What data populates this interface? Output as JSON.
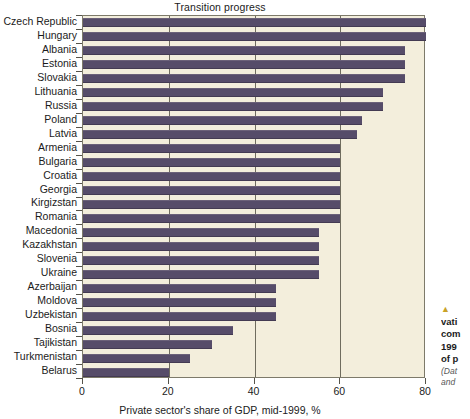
{
  "chart_data": {
    "type": "bar",
    "orientation": "horizontal",
    "title": "Transition progress",
    "xlabel": "Private sector's share of GDP, mid-1999, %",
    "ylabel": "",
    "xlim": [
      0,
      80
    ],
    "xticks": [
      0,
      20,
      40,
      60,
      80
    ],
    "grid": true,
    "grid_axis": "x",
    "legend": null,
    "series_color": "#564c69",
    "plot_background": "#f3eedc",
    "categories": [
      "Czech Republic",
      "Hungary",
      "Albania",
      "Estonia",
      "Slovakia",
      "Lithuania",
      "Russia",
      "Poland",
      "Latvia",
      "Armenia",
      "Bulgaria",
      "Croatia",
      "Georgia",
      "Kirgizstan",
      "Romania",
      "Macedonia",
      "Kazakhstan",
      "Slovenia",
      "Ukraine",
      "Azerbaijan",
      "Moldova",
      "Uzbekistan",
      "Bosnia",
      "Tajikistan",
      "Turkmenistan",
      "Belarus"
    ],
    "values": [
      80,
      80,
      75,
      75,
      75,
      70,
      70,
      65,
      64,
      60,
      60,
      60,
      60,
      60,
      60,
      55,
      55,
      55,
      55,
      45,
      45,
      45,
      35,
      30,
      25,
      20
    ]
  },
  "caption": {
    "marker": "▲",
    "lines": [
      "vati",
      "com",
      "199",
      "of p"
    ],
    "source_lines": [
      "(Dat",
      "and"
    ]
  }
}
